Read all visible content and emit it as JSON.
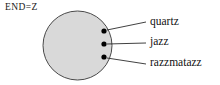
{
  "figure": {
    "set_label": "END=Z",
    "circle": {
      "fill_color": "#d9d9d9",
      "stroke_color": "#4a4a4a",
      "center_x": 77.5,
      "center_y": 45.5,
      "radius": 34.5
    },
    "dot_color": "#000000",
    "leader_color": "#2b2b2b",
    "members": [
      {
        "label": "quartz",
        "dot_x": 104,
        "dot_y": 31,
        "leader_end_x": 146,
        "leader_end_y": 22
      },
      {
        "label": "jazz",
        "dot_x": 104,
        "dot_y": 44,
        "leader_end_x": 146,
        "leader_end_y": 43
      },
      {
        "label": "razzmatazz",
        "dot_x": 104,
        "dot_y": 57,
        "leader_end_x": 146,
        "leader_end_y": 64
      }
    ]
  }
}
